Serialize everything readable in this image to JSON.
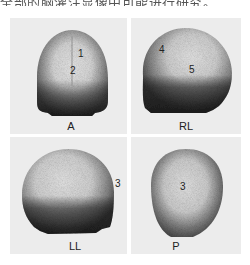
{
  "figure": {
    "header_text_cropped": "全部的脑灌注显像中可能进行研究。",
    "panels": [
      {
        "view": "A",
        "regions": [
          {
            "label": "1"
          },
          {
            "label": "2"
          }
        ]
      },
      {
        "view": "RL",
        "regions": [
          {
            "label": "4"
          },
          {
            "label": "5"
          }
        ]
      },
      {
        "view": "LL",
        "regions": [
          {
            "label": "3"
          }
        ]
      },
      {
        "view": "P",
        "regions": [
          {
            "label": "3"
          }
        ]
      }
    ],
    "colors": {
      "page_bg": "#ffffff",
      "panel_bg": "#ececec",
      "uptake_high": "#e2e2e2",
      "uptake_low": "#3a3a3a"
    }
  }
}
